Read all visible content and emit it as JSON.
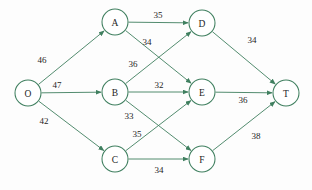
{
  "diagram": {
    "type": "directed-graph",
    "colors": {
      "edge": "#3f7f5f",
      "node_stroke": "#3f7f5f",
      "node_fill": "#ffffff",
      "label_text": "#1d1d1d",
      "background": "#fdfdfd"
    },
    "nodes": [
      {
        "id": "O",
        "label": "O",
        "x": 28,
        "y": 93,
        "r": 13
      },
      {
        "id": "A",
        "label": "A",
        "x": 115,
        "y": 22,
        "r": 13
      },
      {
        "id": "B",
        "label": "B",
        "x": 115,
        "y": 92,
        "r": 13
      },
      {
        "id": "C",
        "label": "C",
        "x": 115,
        "y": 159,
        "r": 13
      },
      {
        "id": "D",
        "label": "D",
        "x": 202,
        "y": 23,
        "r": 13
      },
      {
        "id": "E",
        "label": "E",
        "x": 202,
        "y": 92,
        "r": 13
      },
      {
        "id": "F",
        "label": "F",
        "x": 202,
        "y": 159,
        "r": 13
      },
      {
        "id": "T",
        "label": "T",
        "x": 286,
        "y": 93,
        "r": 13
      }
    ],
    "edges": [
      {
        "id": "O-A",
        "from": "O",
        "to": "A",
        "weight": "46",
        "label_x": 42,
        "label_y": 60
      },
      {
        "id": "O-B",
        "from": "O",
        "to": "B",
        "weight": "47",
        "label_x": 57,
        "label_y": 85
      },
      {
        "id": "O-C",
        "from": "O",
        "to": "C",
        "weight": "42",
        "label_x": 44,
        "label_y": 121
      },
      {
        "id": "A-D",
        "from": "A",
        "to": "D",
        "weight": "35",
        "label_x": 158,
        "label_y": 15
      },
      {
        "id": "A-E",
        "from": "A",
        "to": "E",
        "weight": "34",
        "label_x": 147,
        "label_y": 42
      },
      {
        "id": "B-D",
        "from": "B",
        "to": "D",
        "weight": "36",
        "label_x": 133,
        "label_y": 64
      },
      {
        "id": "B-E",
        "from": "B",
        "to": "E",
        "weight": "32",
        "label_x": 159,
        "label_y": 85
      },
      {
        "id": "B-F",
        "from": "B",
        "to": "F",
        "weight": "33",
        "label_x": 129,
        "label_y": 116
      },
      {
        "id": "C-E",
        "from": "C",
        "to": "E",
        "weight": "35",
        "label_x": 137,
        "label_y": 134
      },
      {
        "id": "C-F",
        "from": "C",
        "to": "F",
        "weight": "34",
        "label_x": 159,
        "label_y": 170
      },
      {
        "id": "D-T",
        "from": "D",
        "to": "T",
        "weight": "34",
        "label_x": 252,
        "label_y": 40
      },
      {
        "id": "E-T",
        "from": "E",
        "to": "T",
        "weight": "36",
        "label_x": 243,
        "label_y": 100
      },
      {
        "id": "F-T",
        "from": "F",
        "to": "T",
        "weight": "38",
        "label_x": 256,
        "label_y": 136
      }
    ]
  }
}
